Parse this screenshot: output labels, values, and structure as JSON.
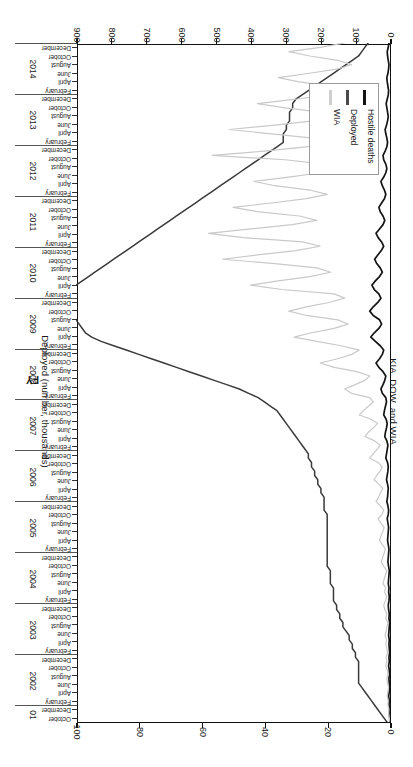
{
  "chart_data": {
    "type": "line",
    "title": "",
    "xlabel": "FY",
    "ylabel": "KIA, DOW, and WIA",
    "y2label": "Deployed (number, thousands)",
    "ylim": [
      0,
      900
    ],
    "y2lim": [
      0,
      100
    ],
    "grid": false,
    "legend_position": "bottom-left",
    "y_ticks": [
      0,
      100,
      200,
      300,
      400,
      500,
      600,
      700,
      800,
      900
    ],
    "y2_ticks": [
      0,
      20,
      40,
      60,
      80,
      100
    ],
    "month_labels": [
      "February",
      "April",
      "June",
      "August",
      "October",
      "December"
    ],
    "fiscal_years": [
      "01",
      "2002",
      "2003",
      "2004",
      "2005",
      "2006",
      "2007",
      "2008",
      "2009",
      "2010",
      "2011",
      "2012",
      "2013",
      "2014"
    ],
    "first_year_months": [
      "October",
      "December"
    ],
    "series": [
      {
        "name": "Hostile deaths",
        "color": "#141414",
        "axis": "left",
        "values": [
          0,
          1,
          2,
          1,
          3,
          2,
          4,
          2,
          1,
          2,
          3,
          1,
          2,
          4,
          2,
          3,
          1,
          2,
          3,
          2,
          4,
          3,
          2,
          1,
          3,
          2,
          4,
          5,
          3,
          2,
          4,
          3,
          5,
          4,
          3,
          2,
          4,
          6,
          5,
          4,
          3,
          5,
          7,
          6,
          5,
          4,
          6,
          8,
          5,
          4,
          6,
          9,
          7,
          6,
          5,
          7,
          10,
          8,
          6,
          5,
          7,
          12,
          10,
          8,
          6,
          9,
          15,
          13,
          10,
          8,
          11,
          18,
          16,
          13,
          10,
          12,
          22,
          26,
          20,
          15,
          12,
          20,
          32,
          40,
          30,
          22,
          18,
          28,
          42,
          55,
          45,
          32,
          24,
          30,
          48,
          58,
          48,
          35,
          26,
          32,
          45,
          52,
          42,
          30,
          22,
          28,
          38,
          44,
          35,
          25,
          18,
          24,
          34,
          40,
          30,
          20,
          15,
          20,
          28,
          32,
          24,
          16,
          12,
          16,
          22,
          26,
          18,
          12,
          9,
          12,
          18,
          20,
          14,
          9,
          7,
          9,
          12,
          14,
          10,
          7,
          5,
          7,
          9,
          11,
          8,
          5,
          4,
          6,
          8,
          9,
          6,
          4,
          3,
          5,
          7,
          8,
          5,
          3
        ]
      },
      {
        "name": "Deployed",
        "color": "#3a3a3a",
        "axis": "right",
        "values": [
          1,
          2,
          3,
          4,
          5,
          6,
          7,
          8,
          9,
          10,
          10,
          10,
          10,
          10,
          10,
          11,
          11,
          12,
          12,
          13,
          13,
          14,
          15,
          15,
          16,
          16,
          17,
          17,
          18,
          18,
          18,
          18,
          19,
          19,
          19,
          19,
          20,
          20,
          20,
          20,
          20,
          20,
          20,
          20,
          20,
          20,
          20,
          20,
          20,
          21,
          21,
          21,
          21,
          22,
          22,
          23,
          23,
          24,
          24,
          25,
          25,
          26,
          26,
          27,
          28,
          29,
          30,
          31,
          32,
          33,
          34,
          35,
          36,
          38,
          40,
          42,
          45,
          48,
          52,
          56,
          60,
          64,
          68,
          72,
          76,
          80,
          84,
          88,
          92,
          95,
          97,
          98,
          99,
          100,
          101,
          102,
          103,
          104,
          105,
          104,
          102,
          100,
          98,
          96,
          94,
          92,
          90,
          88,
          86,
          84,
          82,
          80,
          78,
          76,
          74,
          72,
          70,
          68,
          66,
          64,
          62,
          60,
          58,
          56,
          54,
          52,
          50,
          48,
          46,
          44,
          42,
          40,
          38,
          36,
          34,
          34,
          34,
          33,
          33,
          32,
          32,
          32,
          31,
          31,
          30,
          28,
          26,
          24,
          22,
          20,
          18,
          16,
          14,
          12,
          10,
          9,
          8,
          7,
          6,
          5,
          4,
          3
        ]
      },
      {
        "name": "WIA",
        "color": "#c9c9c9",
        "axis": "left",
        "values": [
          0,
          2,
          4,
          3,
          6,
          5,
          8,
          6,
          4,
          7,
          9,
          6,
          8,
          12,
          9,
          11,
          7,
          9,
          12,
          10,
          14,
          11,
          9,
          6,
          12,
          9,
          15,
          18,
          13,
          9,
          16,
          12,
          20,
          17,
          13,
          9,
          18,
          25,
          21,
          17,
          13,
          22,
          30,
          26,
          21,
          17,
          26,
          34,
          23,
          18,
          28,
          40,
          33,
          27,
          21,
          32,
          46,
          38,
          28,
          22,
          34,
          58,
          48,
          38,
          28,
          44,
          72,
          62,
          48,
          36,
          54,
          88,
          76,
          62,
          48,
          58,
          110,
          130,
          100,
          72,
          58,
          95,
          160,
          200,
          150,
          110,
          88,
          140,
          210,
          275,
          225,
          160,
          120,
          150,
          240,
          290,
          240,
          175,
          130,
          160,
          310,
          400,
          320,
          230,
          170,
          210,
          330,
          480,
          380,
          270,
          200,
          250,
          420,
          520,
          400,
          280,
          210,
          260,
          380,
          450,
          340,
          240,
          180,
          230,
          330,
          390,
          290,
          200,
          150,
          190,
          300,
          510,
          360,
          240,
          180,
          220,
          340,
          460,
          330,
          220,
          160,
          200,
          300,
          380,
          270,
          180,
          130,
          170,
          260,
          320,
          230,
          150,
          110,
          150,
          230,
          290,
          200,
          130
        ]
      }
    ]
  },
  "axes": {
    "left_title": "KIA, DOW, and WIA",
    "right_title": "Deployed (number, thousands)",
    "x_title": "FY"
  },
  "legend": {
    "items": [
      {
        "label": "Hostile deaths",
        "color": "#141414",
        "width": "3.4px"
      },
      {
        "label": "Deployed",
        "color": "#4a4a4a",
        "width": "3.0px"
      },
      {
        "label": "WIA",
        "color": "#cfcfcf",
        "width": "2.6px"
      }
    ]
  }
}
